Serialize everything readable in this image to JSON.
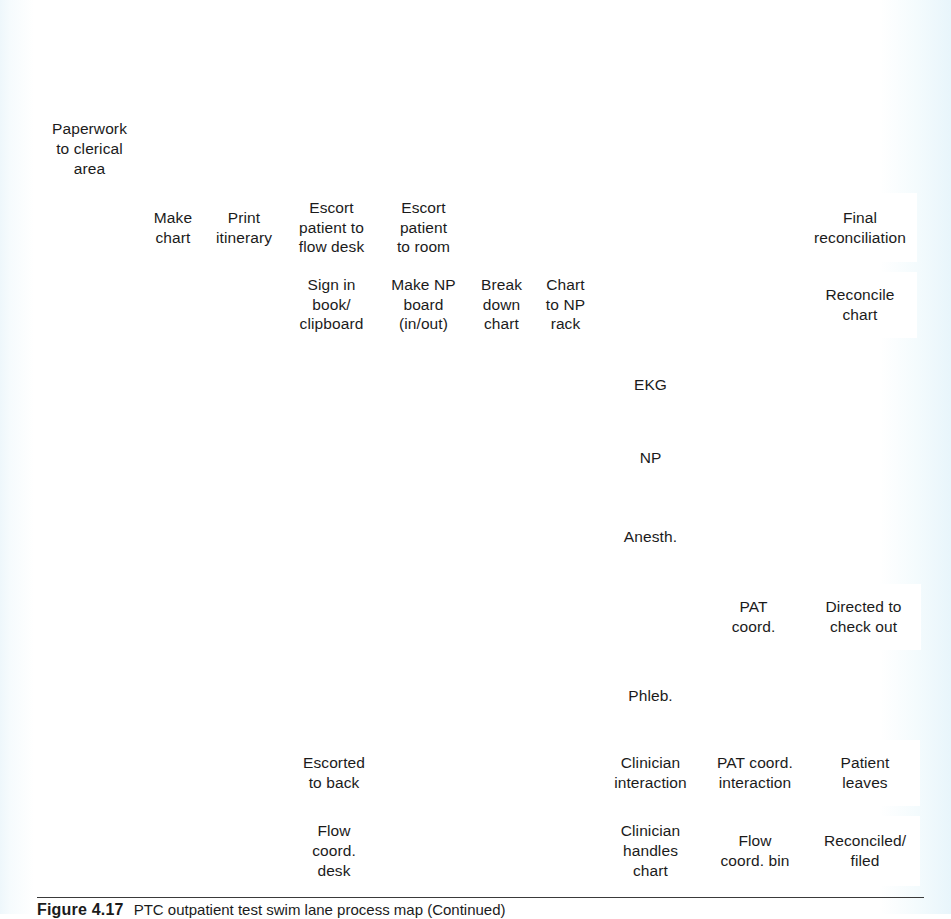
{
  "figure": {
    "label": "Figure 4.17",
    "caption": "PTC outpatient test swim lane process map (Continued)"
  },
  "diagram": {
    "type": "swim-lane-process-map",
    "box_border_color": "#262626",
    "box_fill_color": "#ffffff",
    "boxes": [
      {
        "id": "paperwork-to-clerical-area",
        "text": "Paperwork\nto clerical\narea",
        "x": 38,
        "y": 114,
        "w": 103,
        "h": 70
      },
      {
        "id": "make-chart",
        "text": "Make\nchart",
        "x": 142,
        "y": 193,
        "w": 62,
        "h": 69
      },
      {
        "id": "print-itinerary",
        "text": "Print\nitinerary",
        "x": 206,
        "y": 193,
        "w": 76,
        "h": 69
      },
      {
        "id": "escort-patient-to-flow-desk",
        "text": "Escort\npatient to\nflow desk",
        "x": 285,
        "y": 193,
        "w": 93,
        "h": 69
      },
      {
        "id": "escort-patient-to-room",
        "text": "Escort\npatient\nto room",
        "x": 381,
        "y": 193,
        "w": 85,
        "h": 69
      },
      {
        "id": "final-reconciliation",
        "text": "Final\nreconciliation",
        "x": 803,
        "y": 193,
        "w": 114,
        "h": 69
      },
      {
        "id": "sign-in-book-clipboard",
        "text": "Sign in\nbook/\nclipboard",
        "x": 285,
        "y": 270,
        "w": 93,
        "h": 69
      },
      {
        "id": "make-np-board-in-out",
        "text": "Make NP\nboard\n(in/out)",
        "x": 381,
        "y": 270,
        "w": 85,
        "h": 69
      },
      {
        "id": "break-down-chart",
        "text": "Break\ndown\nchart",
        "x": 471,
        "y": 270,
        "w": 61,
        "h": 69
      },
      {
        "id": "chart-to-np-rack",
        "text": "Chart\nto NP\nrack",
        "x": 535,
        "y": 270,
        "w": 61,
        "h": 69
      },
      {
        "id": "reconcile-chart",
        "text": "Reconcile\nchart",
        "x": 803,
        "y": 272,
        "w": 114,
        "h": 66
      },
      {
        "id": "ekg",
        "text": "EKG",
        "x": 602,
        "y": 352,
        "w": 97,
        "h": 66
      },
      {
        "id": "np",
        "text": "NP",
        "x": 602,
        "y": 425,
        "w": 97,
        "h": 66
      },
      {
        "id": "anesth",
        "text": "Anesth.",
        "x": 602,
        "y": 504,
        "w": 97,
        "h": 66
      },
      {
        "id": "pat-coord",
        "text": "PAT\ncoord.",
        "x": 706,
        "y": 584,
        "w": 95,
        "h": 66
      },
      {
        "id": "directed-to-check-out",
        "text": "Directed to\ncheck out",
        "x": 806,
        "y": 584,
        "w": 115,
        "h": 66
      },
      {
        "id": "phleb",
        "text": "Phleb.",
        "x": 602,
        "y": 663,
        "w": 97,
        "h": 66
      },
      {
        "id": "escorted-to-back",
        "text": "Escorted\nto back",
        "x": 287,
        "y": 740,
        "w": 94,
        "h": 66
      },
      {
        "id": "clinician-interaction",
        "text": "Clinician\ninteraction",
        "x": 602,
        "y": 740,
        "w": 97,
        "h": 66
      },
      {
        "id": "pat-coord-interaction",
        "text": "PAT coord.\ninteraction",
        "x": 706,
        "y": 740,
        "w": 98,
        "h": 66
      },
      {
        "id": "patient-leaves",
        "text": "Patient\nleaves",
        "x": 810,
        "y": 740,
        "w": 110,
        "h": 66
      },
      {
        "id": "flow-coord-desk",
        "text": "Flow\ncoord.\ndesk",
        "x": 287,
        "y": 816,
        "w": 94,
        "h": 70
      },
      {
        "id": "clinician-handles-chart",
        "text": "Clinician\nhandles\nchart",
        "x": 602,
        "y": 816,
        "w": 97,
        "h": 70
      },
      {
        "id": "flow-coord-bin",
        "text": "Flow\ncoord. bin",
        "x": 706,
        "y": 816,
        "w": 98,
        "h": 70
      },
      {
        "id": "reconciled-filed",
        "text": "Reconciled/\nfiled",
        "x": 810,
        "y": 816,
        "w": 110,
        "h": 70
      }
    ]
  }
}
